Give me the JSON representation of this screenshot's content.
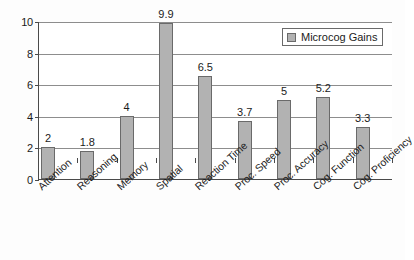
{
  "chart_data": {
    "type": "bar",
    "title": "",
    "subtitle": "",
    "xlabel": "",
    "ylabel": "",
    "ylim": [
      0,
      10
    ],
    "y_ticks": [
      0,
      2,
      4,
      6,
      8,
      10
    ],
    "grid": true,
    "legend_position": "top-right",
    "categories": [
      "Attention",
      "Reasoning",
      "Memory",
      "Spatial",
      "Reaction Time",
      "Proc. Speed",
      "Proc. Accuracy",
      "Cog. Function",
      "Cog. Proficiency"
    ],
    "series": [
      {
        "name": "Microcog Gains",
        "values": [
          2,
          1.8,
          4,
          9.9,
          6.5,
          3.7,
          5,
          5.2,
          3.3
        ],
        "labels": [
          "2",
          "1.8",
          "4",
          "9.9",
          "6.5",
          "3.7",
          "5",
          "5.2",
          "3.3"
        ],
        "color": "#b2b2b2",
        "border_color": "#6a6a6a"
      }
    ],
    "legend": [
      {
        "label": "Microcog Gains",
        "color": "#b2b2b2"
      }
    ]
  },
  "colors": {
    "bar_fill": "#b2b2b2",
    "bar_stroke": "#6a6a6a",
    "axis": "#4a4a4a",
    "gridline": "#8d8d8d",
    "plot_background": "#ffffff",
    "page_background": "#fdfdfd",
    "text": "#1b1b1b"
  }
}
